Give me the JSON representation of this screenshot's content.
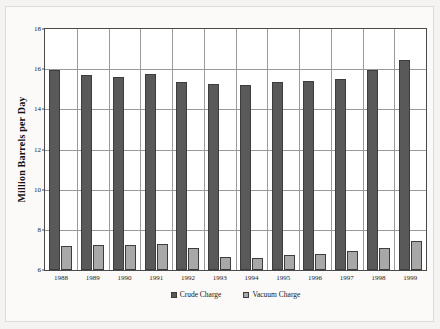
{
  "chart_data": {
    "type": "bar",
    "title": "",
    "subtitle": "",
    "xlabel": "",
    "ylabel": "Million Barrels per Day",
    "categories": [
      "1988",
      "1989",
      "1990",
      "1991",
      "1992",
      "1993",
      "1994",
      "1995",
      "1996",
      "1997",
      "1998",
      "1999"
    ],
    "series": [
      {
        "name": "Crude Charge",
        "color": "#595959",
        "values": [
          15.95,
          15.7,
          15.6,
          15.75,
          15.35,
          15.25,
          15.2,
          15.35,
          15.4,
          15.5,
          15.95,
          16.45
        ]
      },
      {
        "name": "Vacuum Charge",
        "color": "#a8a8a8",
        "values": [
          7.2,
          7.25,
          7.25,
          7.3,
          7.1,
          6.65,
          6.6,
          6.75,
          6.8,
          6.95,
          7.1,
          7.45
        ]
      }
    ],
    "ylim": [
      6,
      18
    ],
    "ytick_values": [
      6,
      8,
      10,
      12,
      14,
      16,
      18
    ],
    "ytick_labels": [
      "6",
      "8",
      "10",
      "12",
      "14",
      "16",
      "18"
    ],
    "grid": {
      "horizontal": true,
      "vertical": true,
      "color": "#9a9a9a"
    },
    "legend": {
      "position": "bottom-center",
      "entries": [
        {
          "label": "Crude Charge",
          "swatch": "legend-swatch-crude"
        },
        {
          "label": "Vacuum Charge",
          "swatch": "legend-swatch-vacuum"
        }
      ]
    },
    "plot_background": "#ffffff",
    "frame_color": "#4a4a4a"
  }
}
